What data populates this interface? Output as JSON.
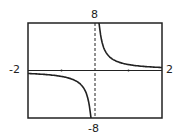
{
  "chart_data": {
    "type": "line",
    "title": "",
    "function": "y = 1/x",
    "xlabel": "",
    "ylabel": "",
    "xlim": [
      -2,
      2
    ],
    "ylim": [
      -8,
      8
    ],
    "grid": false,
    "x_tick_marks": [
      -1,
      1
    ],
    "tick_labels": {
      "xmin": "-2",
      "xmax": "2",
      "ymin": "-8",
      "ymax": "8"
    },
    "series": [
      {
        "name": "1/x",
        "x": [
          -2,
          -1.5,
          -1,
          -0.5,
          -0.25,
          -0.125,
          0.125,
          0.25,
          0.5,
          1,
          1.5,
          2
        ],
        "values": [
          -0.5,
          -0.67,
          -1,
          -2,
          -4,
          -8,
          8,
          4,
          2,
          1,
          0.67,
          0.5
        ]
      }
    ],
    "vertical_asymptote": 0,
    "colors": {
      "curve": "#222222",
      "axes": "#222222",
      "frame": "#222222"
    }
  }
}
